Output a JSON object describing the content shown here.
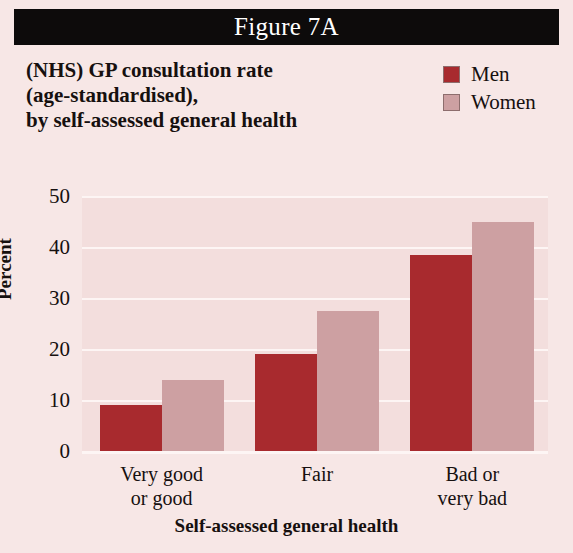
{
  "banner": {
    "figure_label": "Figure 7A"
  },
  "title": {
    "line1": "(NHS) GP consultation rate",
    "line2": "(age-standardised),",
    "line3": "by self-assessed general health"
  },
  "legend": {
    "items": [
      {
        "label": "Men",
        "color": "#a82a2e"
      },
      {
        "label": "Women",
        "color": "#cda0a2"
      }
    ]
  },
  "axes": {
    "y_title": "Percent",
    "x_title": "Self-assessed general health",
    "y_ticks": [
      "0",
      "10",
      "20",
      "30",
      "40",
      "50"
    ]
  },
  "categories_display": [
    {
      "line1": "Very good",
      "line2": "or good"
    },
    {
      "line1": "Fair",
      "line2": ""
    },
    {
      "line1": "Bad or",
      "line2": "very bad"
    }
  ],
  "colors": {
    "background": "#f7e7e6",
    "plot_background": "#f3dedd",
    "banner": "#0d0b0b",
    "gridline": "#fdf5f4",
    "men": "#a82a2e",
    "women": "#cda0a2",
    "text": "#16100f"
  },
  "chart_data": {
    "type": "bar",
    "title": "(NHS) GP consultation rate (age-standardised), by self-assessed general health",
    "figure_label": "Figure 7A",
    "xlabel": "Self-assessed general health",
    "ylabel": "Percent",
    "categories": [
      "Very good or good",
      "Fair",
      "Bad or very bad"
    ],
    "series": [
      {
        "name": "Men",
        "color": "#a82a2e",
        "values": [
          9,
          19,
          38.5
        ]
      },
      {
        "name": "Women",
        "color": "#cda0a2",
        "values": [
          14,
          27.5,
          45
        ]
      }
    ],
    "ylim": [
      0,
      50
    ],
    "ytick_values": [
      0,
      10,
      20,
      30,
      40,
      50
    ],
    "grid": true,
    "legend_position": "top-right"
  }
}
